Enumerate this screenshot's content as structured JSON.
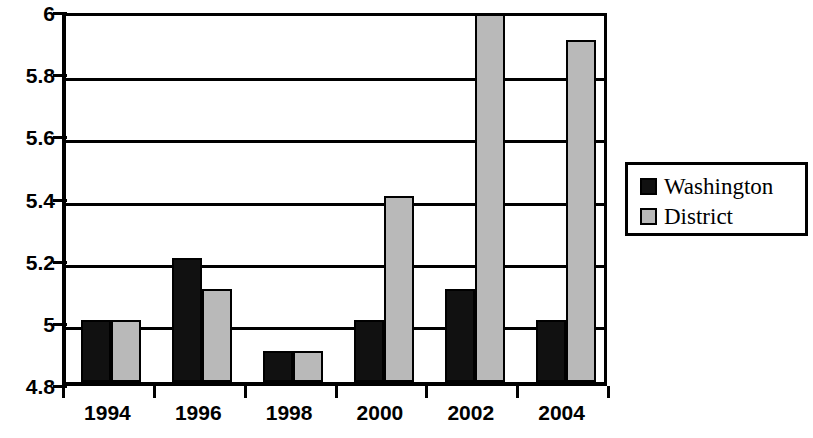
{
  "chart_data": {
    "type": "bar",
    "title": "",
    "subtitle": "",
    "xlabel": "",
    "ylabel": "",
    "categories": [
      "1994",
      "1996",
      "1998",
      "2000",
      "2002",
      "2004"
    ],
    "series": [
      {
        "name": "Washington",
        "color": "#111111",
        "values": [
          5.0,
          5.2,
          4.9,
          5.0,
          5.1,
          5.0
        ]
      },
      {
        "name": "District",
        "color": "#b9b9b9",
        "values": [
          5.0,
          5.1,
          4.9,
          5.4,
          6.0,
          5.9
        ]
      }
    ],
    "ylim": [
      4.8,
      6.0
    ],
    "y_ticks": [
      4.8,
      5.0,
      5.2,
      5.4,
      5.6,
      5.8,
      6.0
    ],
    "y_tick_labels": [
      "4.8",
      "5",
      "5.2",
      "5.4",
      "5.6",
      "5.8",
      "6"
    ],
    "grid": true,
    "grid_axis": "y",
    "legend_position": "right"
  },
  "legend": {
    "entries": [
      {
        "label": "Washington",
        "swatch": "black-square-swatch"
      },
      {
        "label": "District",
        "swatch": "gray-square-swatch"
      }
    ]
  }
}
